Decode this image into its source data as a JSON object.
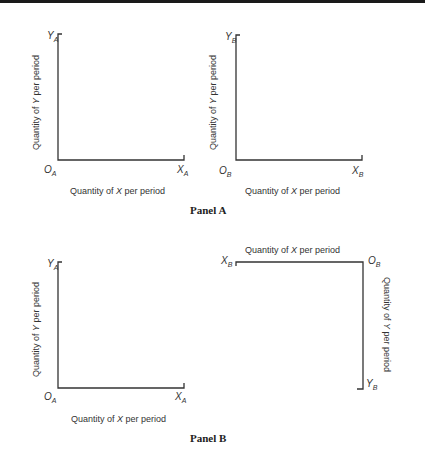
{
  "panels": [
    {
      "title": "Panel A",
      "diagrams": [
        {
          "name": "A",
          "origin_label": "O",
          "origin_sub": "A",
          "x_end_label": "X",
          "x_end_sub": "A",
          "y_end_label": "Y",
          "y_end_sub": "A",
          "x_axis_title_pre": "Quantity of ",
          "x_axis_title_var": "X",
          "x_axis_title_post": " per period",
          "y_axis_title_pre": "Quantity of ",
          "y_axis_title_var": "Y",
          "y_axis_title_post": " per period"
        },
        {
          "name": "B",
          "origin_label": "O",
          "origin_sub": "B",
          "x_end_label": "X",
          "x_end_sub": "B",
          "y_end_label": "Y",
          "y_end_sub": "B",
          "x_axis_title_pre": "Quantity of ",
          "x_axis_title_var": "X",
          "x_axis_title_post": " per period",
          "y_axis_title_pre": "Quantity of ",
          "y_axis_title_var": "Y",
          "y_axis_title_post": " per period"
        }
      ]
    },
    {
      "title": "Panel B",
      "diagrams": [
        {
          "name": "A",
          "origin_label": "O",
          "origin_sub": "A",
          "x_end_label": "X",
          "x_end_sub": "A",
          "y_end_label": "Y",
          "y_end_sub": "A",
          "x_axis_title_pre": "Quantity of ",
          "x_axis_title_var": "X",
          "x_axis_title_post": " per period",
          "y_axis_title_pre": "Quantity of ",
          "y_axis_title_var": "Y",
          "y_axis_title_post": " per period"
        },
        {
          "name": "B (rotated 180°)",
          "origin_label": "O",
          "origin_sub": "B",
          "x_end_label": "X",
          "x_end_sub": "B",
          "y_end_label": "Y",
          "y_end_sub": "B",
          "x_axis_title_pre": "Quantity of ",
          "x_axis_title_var": "X",
          "x_axis_title_post": " per period",
          "y_axis_title_pre": "Quantity of ",
          "y_axis_title_var": "Y",
          "y_axis_title_post": " per period"
        }
      ]
    }
  ]
}
